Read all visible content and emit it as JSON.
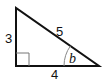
{
  "diagram": {
    "type": "right-triangle",
    "labels": {
      "left_side": "3",
      "hypotenuse": "5",
      "bottom_side": "4",
      "angle": "b"
    },
    "colors": {
      "stroke": "#111111",
      "arc": "#888888",
      "background": "#ffffff"
    }
  }
}
